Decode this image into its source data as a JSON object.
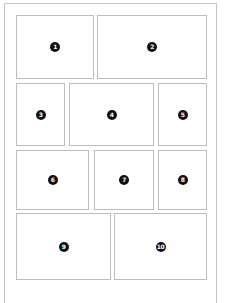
{
  "diagram": {
    "type": "panel-layout",
    "colors": {
      "frame": "#c4c4c4",
      "panel_border": "#bdbdbd",
      "badge_fill": "#111111",
      "badge_text": "#ffffff"
    },
    "panels": [
      {
        "label": "1",
        "x": 16,
        "y": 15,
        "w": 78,
        "h": 64
      },
      {
        "label": "2",
        "x": 97,
        "y": 15,
        "w": 110,
        "h": 64
      },
      {
        "label": "3",
        "x": 16,
        "y": 83,
        "w": 49,
        "h": 63
      },
      {
        "label": "4",
        "x": 69,
        "y": 83,
        "w": 85,
        "h": 63
      },
      {
        "label": "5",
        "x": 158,
        "y": 83,
        "w": 49,
        "h": 63
      },
      {
        "label": "6",
        "x": 16,
        "y": 150,
        "w": 73,
        "h": 60
      },
      {
        "label": "7",
        "x": 94,
        "y": 150,
        "w": 60,
        "h": 60
      },
      {
        "label": "8",
        "x": 158,
        "y": 150,
        "w": 49,
        "h": 60
      },
      {
        "label": "9",
        "x": 16,
        "y": 213,
        "w": 95,
        "h": 67
      },
      {
        "label": "10",
        "x": 114,
        "y": 213,
        "w": 93,
        "h": 67
      }
    ]
  }
}
